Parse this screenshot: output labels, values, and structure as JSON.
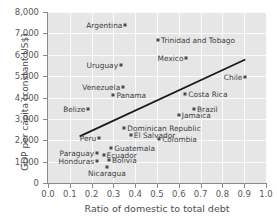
{
  "chart_data": {
    "type": "scatter",
    "title": "",
    "xlabel": "Ratio of domestic to total debt",
    "ylabel": "GDP per capita (constant US$)",
    "xlim": [
      0.0,
      1.0
    ],
    "ylim": [
      0,
      8000
    ],
    "xticks": [
      "0.0",
      "0.1",
      "0.2",
      "0.3",
      "0.4",
      "0.5",
      "0.6",
      "0.7",
      "0.8",
      "0.9",
      "1.0"
    ],
    "xtick_values": [
      0.0,
      0.1,
      0.2,
      0.3,
      0.4,
      0.5,
      0.6,
      0.7,
      0.8,
      0.9,
      1.0
    ],
    "yticks": [
      "0",
      "1,000",
      "2,000",
      "3,000",
      "4,000",
      "5,000",
      "6,000",
      "7,000",
      "8,000"
    ],
    "ytick_values": [
      0,
      1000,
      2000,
      3000,
      4000,
      5000,
      6000,
      7000,
      8000
    ],
    "grid": true,
    "legend": "none",
    "plot_background": "#e6e6e6",
    "gridline_color": "#fbfbfb",
    "marker_color": "#4a4a4a",
    "trendline_color": "#1a1a1a",
    "trendline": {
      "x_start": 0.145,
      "y_start": 2180,
      "x_end": 0.905,
      "y_end": 5780
    },
    "points": [
      {
        "label": "Argentina",
        "x": 0.355,
        "y": 7380,
        "label_pos": "left"
      },
      {
        "label": "Trinidad and Tobago",
        "x": 0.505,
        "y": 6680,
        "label_pos": "right"
      },
      {
        "label": "Mexico",
        "x": 0.635,
        "y": 5840,
        "label_pos": "left"
      },
      {
        "label": "Uruguay",
        "x": 0.335,
        "y": 5500,
        "label_pos": "left"
      },
      {
        "label": "Chile",
        "x": 0.905,
        "y": 4980,
        "label_pos": "left"
      },
      {
        "label": "Venezuela",
        "x": 0.345,
        "y": 4480,
        "label_pos": "left"
      },
      {
        "label": "Costa Rica",
        "x": 0.63,
        "y": 4150,
        "label_pos": "right"
      },
      {
        "label": "Panama",
        "x": 0.3,
        "y": 4100,
        "label_pos": "right"
      },
      {
        "label": "Belize",
        "x": 0.185,
        "y": 3450,
        "label_pos": "left"
      },
      {
        "label": "Brazil",
        "x": 0.67,
        "y": 3440,
        "label_pos": "right"
      },
      {
        "label": "Jamaica",
        "x": 0.6,
        "y": 3200,
        "label_pos": "right"
      },
      {
        "label": "Dominican Republic",
        "x": 0.35,
        "y": 2580,
        "label_pos": "right"
      },
      {
        "label": "El Salvador",
        "x": 0.38,
        "y": 2250,
        "label_pos": "right"
      },
      {
        "label": "Peru",
        "x": 0.235,
        "y": 2120,
        "label_pos": "left"
      },
      {
        "label": "Colombia",
        "x": 0.51,
        "y": 2070,
        "label_pos": "right"
      },
      {
        "label": "Guatemala",
        "x": 0.29,
        "y": 1640,
        "label_pos": "right"
      },
      {
        "label": "Paraguay",
        "x": 0.225,
        "y": 1410,
        "label_pos": "left"
      },
      {
        "label": "Ecuador",
        "x": 0.255,
        "y": 1330,
        "label_pos": "right"
      },
      {
        "label": "Bolivia",
        "x": 0.28,
        "y": 1060,
        "label_pos": "right"
      },
      {
        "label": "Honduras",
        "x": 0.225,
        "y": 1010,
        "label_pos": "left"
      },
      {
        "label": "Nicaragua",
        "x": 0.27,
        "y": 740,
        "label_pos": "below"
      }
    ]
  }
}
